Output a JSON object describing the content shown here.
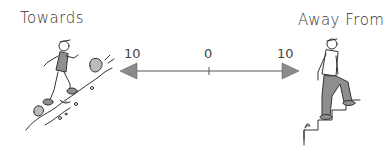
{
  "diagram": {
    "left_label": "Towards",
    "right_label": "Away From",
    "scale": {
      "left_value": "10",
      "center_value": "0",
      "right_value": "10"
    },
    "colors": {
      "arrowhead": "#8a8a8a",
      "line": "#555555",
      "figure_fill": "#8f8f8f"
    }
  }
}
